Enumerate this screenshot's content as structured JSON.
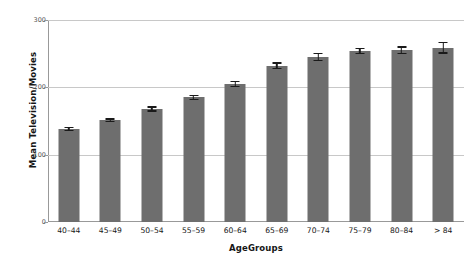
{
  "chart_data": {
    "type": "bar",
    "title": "",
    "xlabel": "AgeGroups",
    "ylabel": "Mean Television/Movies",
    "categories": [
      "40–44",
      "45–49",
      "50–54",
      "55–59",
      "60–64",
      "65–69",
      "70–74",
      "75–79",
      "80–84",
      "> 84"
    ],
    "values": [
      138,
      151,
      168,
      185,
      205,
      232,
      245,
      254,
      255,
      259
    ],
    "errors": [
      3,
      3,
      4,
      4,
      5,
      5,
      6,
      5,
      6,
      9
    ],
    "ylim": [
      0,
      300
    ],
    "yticks": [
      0,
      100,
      200,
      300
    ],
    "ytick_labels": [
      "0",
      "100",
      "200",
      "300"
    ],
    "grid": true,
    "legend": "none",
    "bar_color": "#6e6e6e",
    "errorbar_color": "#1a1a1a",
    "gridline_color": "#c8c8c8",
    "axis_color": "#999999",
    "background_color": "#ffffff"
  }
}
